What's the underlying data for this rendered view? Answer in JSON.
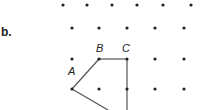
{
  "part_label": "b.",
  "grid": {
    "rows": [
      {
        "y": 5,
        "xs": [
          63,
          87,
          112,
          137,
          163,
          191
        ]
      },
      {
        "y": 28,
        "xs": [
          72,
          99,
          127,
          155,
          184
        ]
      },
      {
        "y": 59,
        "xs": [
          72,
          99,
          127,
          155,
          184
        ]
      },
      {
        "y": 89,
        "xs": [
          72,
          99,
          127,
          155,
          184
        ]
      }
    ],
    "dot_color": "#222222"
  },
  "points": {
    "A": {
      "label": "A",
      "x": 72,
      "y": 89,
      "label_x": 68,
      "label_y": 75
    },
    "B": {
      "label": "B",
      "x": 99,
      "y": 59,
      "label_x": 96,
      "label_y": 52
    },
    "C": {
      "label": "C",
      "x": 127,
      "y": 59,
      "label_x": 122,
      "label_y": 52
    }
  },
  "segments": [
    {
      "from": "A",
      "to": "B"
    },
    {
      "from": "B",
      "to": "C"
    },
    {
      "from": "C",
      "to": "bottom",
      "x2": 127,
      "y2": 110
    },
    {
      "from": "A",
      "to": "bottom",
      "x2": 108,
      "y2": 110
    }
  ],
  "line_color": "#555555"
}
